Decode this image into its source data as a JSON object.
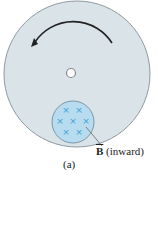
{
  "figure": {
    "caption": "(a)",
    "field_label_symbol": "B",
    "field_label_text": " (inward)",
    "field_marker": "×",
    "field_marker_count": 7,
    "rotation_direction": "counterclockwise",
    "colors": {
      "disk": "#d9e3e8",
      "disk_edge": "#8e9aa2",
      "field_region": "#b8dcef",
      "field_marker": "#3aa0d8",
      "arrow": "#222222"
    }
  }
}
